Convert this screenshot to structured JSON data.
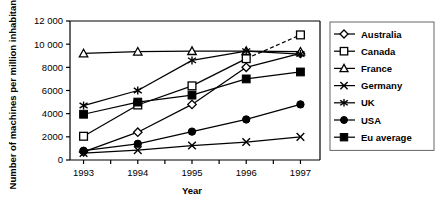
{
  "chart_data": {
    "type": "line",
    "title": "",
    "xlabel": "Year",
    "ylabel": "Number of machines per million inhabitants",
    "categories": [
      1993,
      1994,
      1995,
      1996,
      1997
    ],
    "xtick_labels": [
      "1993",
      "1994",
      "1995",
      "1996",
      "1997"
    ],
    "ytick_labels": [
      "0",
      "2000",
      "4000",
      "6000",
      "8000",
      "10 000",
      "12 000"
    ],
    "yticks": [
      0,
      2000,
      4000,
      6000,
      8000,
      10000,
      12000
    ],
    "ylim": [
      0,
      12000
    ],
    "xlim": [
      1992.75,
      1997.25
    ],
    "grid": false,
    "legend_position": "right",
    "series": [
      {
        "name": "Australia",
        "marker": "open-diamond",
        "values": [
          700,
          2400,
          4800,
          8000,
          9200
        ]
      },
      {
        "name": "Canada",
        "marker": "open-square",
        "values": [
          2050,
          4750,
          6400,
          8750,
          10800
        ],
        "dashed_last_segment": true
      },
      {
        "name": "France",
        "marker": "open-triangle",
        "values": [
          9200,
          9350,
          9400,
          9400,
          9350
        ]
      },
      {
        "name": "Germany",
        "marker": "cross-x",
        "values": [
          600,
          850,
          1250,
          1550,
          2000
        ]
      },
      {
        "name": "UK",
        "marker": "asterisk",
        "values": [
          4700,
          6000,
          8600,
          9400,
          9150
        ]
      },
      {
        "name": "USA",
        "marker": "filled-circle",
        "values": [
          800,
          1400,
          2450,
          3500,
          4800
        ]
      },
      {
        "name": "Eu average",
        "marker": "filled-square",
        "values": [
          3950,
          5000,
          5600,
          7000,
          7600
        ]
      }
    ]
  },
  "legend": {
    "items": [
      {
        "label": "Australia"
      },
      {
        "label": "Canada"
      },
      {
        "label": "France"
      },
      {
        "label": "Germany"
      },
      {
        "label": "UK"
      },
      {
        "label": "USA"
      },
      {
        "label": "Eu average"
      }
    ]
  },
  "colors": {
    "line": "#000000",
    "frame": "#000000",
    "background": "#ffffff"
  }
}
